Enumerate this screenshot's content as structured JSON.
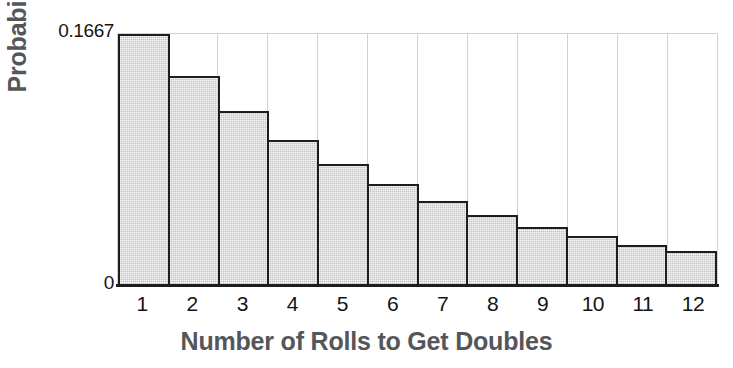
{
  "chart_data": {
    "type": "bar",
    "title": "",
    "xlabel": "Number of Rolls to Get Doubles",
    "ylabel": "Probability",
    "categories": [
      "1",
      "2",
      "3",
      "4",
      "5",
      "6",
      "7",
      "8",
      "9",
      "10",
      "11",
      "12"
    ],
    "values": [
      0.1667,
      0.1389,
      0.1157,
      0.0964,
      0.0804,
      0.067,
      0.0558,
      0.0465,
      0.0388,
      0.0323,
      0.0269,
      0.0224
    ],
    "ylim": [
      0,
      0.1667
    ],
    "ytick_labels": [
      "0",
      "0.1667"
    ],
    "ytick_top": "0.1667",
    "ytick_zero": "0",
    "grid": "vertical",
    "legend": "none",
    "bar_fill_color": "#c4c4c4",
    "bar_edge_color": "#1d1d1d",
    "axis_color": "#1d1d1d",
    "gridline_color": "#d2d2d2",
    "label_color": "#55565a",
    "tick_color": "#141414",
    "background_color": "#ffffff"
  }
}
